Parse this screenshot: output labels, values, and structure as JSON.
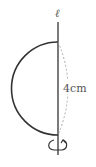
{
  "diagram": {
    "axis_label": "ℓ",
    "dimension_label": "4cm",
    "shape": "semicircle rotated about axis",
    "colors": {
      "stroke": "#333333",
      "dashed": "#999999",
      "text": "#555555"
    }
  }
}
